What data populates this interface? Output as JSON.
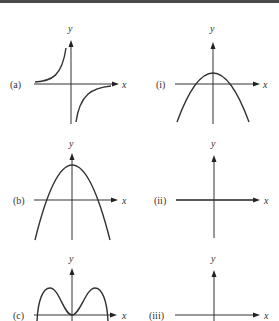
{
  "figure": {
    "left_column": [
      {
        "label": "(a)",
        "x_axis": "x",
        "y_axis": "y",
        "curve": "hyperbola y = -1/x"
      },
      {
        "label": "(b)",
        "x_axis": "x",
        "y_axis": "y",
        "curve": "downward parabola with vertex above x-axis"
      },
      {
        "label": "(c)",
        "x_axis": "x",
        "y_axis": "y",
        "curve": "double hump touching origin"
      }
    ],
    "right_column": [
      {
        "label": "(i)",
        "x_axis": "x",
        "y_axis": "y",
        "curve": "downward parabola with small positive vertex"
      },
      {
        "label": "(ii)",
        "x_axis": "x",
        "y_axis": "y",
        "curve": "horizontal line on x-axis"
      },
      {
        "label": "(iii)",
        "x_axis": "x",
        "y_axis": "y",
        "curve": "blank axes"
      }
    ]
  },
  "colors": {
    "ink": "#333333",
    "topbar": "#4a4a4a",
    "background": "#ffffff"
  }
}
